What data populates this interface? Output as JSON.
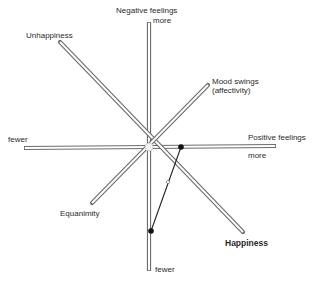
{
  "diagram": {
    "type": "radial-axes",
    "center": [
      149,
      147
    ],
    "axes": [
      {
        "id": "negative-feelings",
        "label": "Negative feelings",
        "end_more": "more",
        "end_fewer": "fewer",
        "from": [
          149,
          22
        ],
        "to": [
          149,
          271
        ]
      },
      {
        "id": "positive-feelings",
        "label": "Positive feelings",
        "end_more": "more",
        "end_fewer": "fewer",
        "from": [
          24,
          148
        ],
        "to": [
          276,
          146
        ]
      },
      {
        "id": "unhappiness-happiness",
        "label_start": "Unhappiness",
        "label_end": "Happiness",
        "from": [
          60,
          42
        ],
        "to": [
          243,
          232
        ]
      },
      {
        "id": "moodswings-equanimity",
        "label_start": "Mood swings (affectivity)",
        "label_end": "Equanimity",
        "from": [
          208,
          85
        ],
        "to": [
          92,
          203
        ]
      }
    ],
    "points": [
      {
        "name": "positive-feelings-point",
        "x": 181,
        "y": 147
      },
      {
        "name": "negative-feelings-point",
        "x": 151,
        "y": 231
      }
    ],
    "connector": {
      "from": [
        181,
        147
      ],
      "to": [
        151,
        231
      ]
    },
    "labels": {
      "negative_feelings": "Negative feelings",
      "negative_more": "more",
      "vertical_fewer": "fewer",
      "unhappiness": "Unhappiness",
      "mood_swings_line1": "Mood swings",
      "mood_swings_line2": "(affectivity)",
      "horizontal_fewer": "fewer",
      "positive_feelings": "Positive feelings",
      "positive_more": "more",
      "equanimity": "Equanimity",
      "happiness": "Happiness"
    },
    "colors": {
      "axis_outline": "#6b6b6b",
      "axis_fill": "#ffffff",
      "point": "#111111",
      "connector": "#222222"
    }
  }
}
